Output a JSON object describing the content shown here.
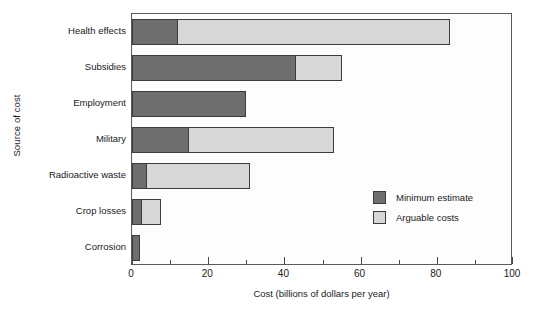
{
  "chart_data": {
    "type": "bar",
    "orientation": "horizontal",
    "stacked": true,
    "title": "",
    "xlabel": "Cost (billions of dollars per year)",
    "ylabel": "Source of cost",
    "categories": [
      "Health effects",
      "Subsidies",
      "Employment",
      "Military",
      "Radioactive waste",
      "Crop losses",
      "Corrosion"
    ],
    "series": [
      {
        "name": "Minimum estimate",
        "color": "#6e6e6e",
        "values": [
          12,
          43,
          30,
          15,
          4,
          2.5,
          2
        ]
      },
      {
        "name": "Arguable costs",
        "color": "#d7d7d7",
        "values": [
          71.5,
          12,
          0,
          38,
          27,
          5,
          0
        ]
      }
    ],
    "totals": [
      83.5,
      55,
      30,
      53,
      31,
      7.5,
      2
    ],
    "xlim": [
      0,
      100
    ],
    "xticks": [
      0,
      20,
      40,
      60,
      80,
      100
    ],
    "xticklabels": [
      "0",
      "20",
      "40",
      "60",
      "80",
      "100"
    ],
    "xminorticks": [
      10,
      30,
      50,
      70,
      90
    ],
    "grid": false,
    "legend_position": "center-right",
    "legend": [
      {
        "label": "Minimum estimate",
        "color": "#6e6e6e"
      },
      {
        "label": "Arguable costs",
        "color": "#d7d7d7"
      }
    ]
  }
}
